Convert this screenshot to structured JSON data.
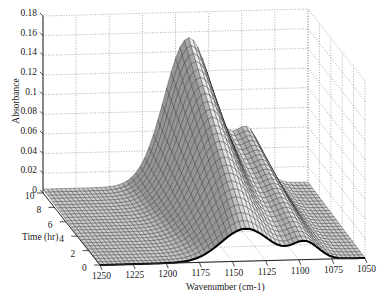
{
  "chart_data": {
    "type": "surface",
    "title": "",
    "xlabel": "Wavenumber (cm-1)",
    "ylabel": "Time (hr)",
    "zlabel": "Absorbance",
    "x_ticks": [
      "1250",
      "1225",
      "1200",
      "1175",
      "1150",
      "1125",
      "1100",
      "1075",
      "1050"
    ],
    "y_ticks": [
      "0",
      "2",
      "4",
      "6",
      "8",
      "10"
    ],
    "z_ticks": [
      "0",
      "0.02",
      "0.04",
      "0.06",
      "0.08",
      "0.1",
      "0.12",
      "0.14",
      "0.16",
      "0.18"
    ],
    "xlim": [
      1250,
      1050
    ],
    "ylim": [
      0,
      10
    ],
    "zlim": [
      0,
      0.18
    ],
    "grid": true,
    "style": "wireframe mesh, grayscale",
    "peak": {
      "wavenumber": 1140,
      "time_hr": 10,
      "absorbance": 0.15
    },
    "shoulder": {
      "wavenumber": 1095,
      "time_hr": 10,
      "absorbance": 0.075
    },
    "series_at_time_10": {
      "x": [
        1250,
        1225,
        1200,
        1175,
        1160,
        1150,
        1140,
        1130,
        1120,
        1110,
        1100,
        1090,
        1075,
        1060,
        1050
      ],
      "values": [
        0.005,
        0.01,
        0.025,
        0.07,
        0.11,
        0.135,
        0.15,
        0.14,
        0.11,
        0.085,
        0.078,
        0.072,
        0.04,
        0.015,
        0.008
      ]
    },
    "series_at_time_0": {
      "x": [
        1250,
        1225,
        1200,
        1175,
        1160,
        1150,
        1140,
        1130,
        1120,
        1110,
        1100,
        1090,
        1075,
        1060,
        1050
      ],
      "values": [
        0.0,
        0.001,
        0.003,
        0.01,
        0.02,
        0.03,
        0.038,
        0.04,
        0.035,
        0.028,
        0.022,
        0.018,
        0.01,
        0.004,
        0.002
      ]
    }
  }
}
